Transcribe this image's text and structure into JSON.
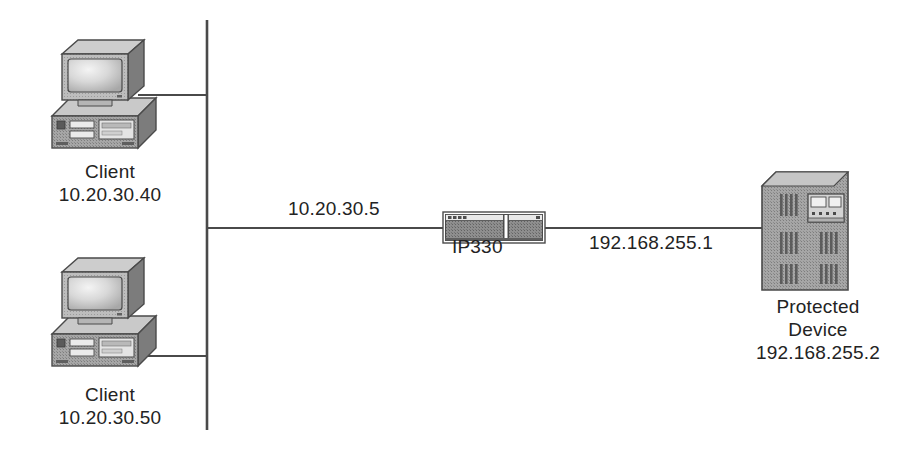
{
  "diagram": {
    "type": "network-topology",
    "title": "",
    "background_color": "#ffffff",
    "line_color": "#4a4a4a",
    "text_color": "#232323",
    "device_fill": "#9a9a9a",
    "device_shade_light": "#c4c4c4",
    "device_shade_dark": "#6e6e6e",
    "nodes": [
      {
        "id": "client-top",
        "icon": "desktop-computer-icon",
        "name": "Client",
        "ip": "10.20.30.40"
      },
      {
        "id": "client-bottom",
        "icon": "desktop-computer-icon",
        "name": "Client",
        "ip": "10.20.30.50"
      },
      {
        "id": "ip330",
        "icon": "firewall-appliance-icon",
        "name": "IP330",
        "ip": ""
      },
      {
        "id": "protected-device",
        "icon": "server-tower-icon",
        "name_line1": "Protected",
        "name_line2": "Device",
        "ip": "192.168.255.2"
      }
    ],
    "links": [
      {
        "id": "lan-trunk",
        "from": "lan-bus",
        "to": "ip330",
        "label": "10.20.30.5"
      },
      {
        "id": "wan-link",
        "from": "ip330",
        "to": "protected-device",
        "label": "192.168.255.1"
      }
    ]
  },
  "labels": {
    "client_top_name": "Client",
    "client_top_ip": "10.20.30.40",
    "client_bottom_name": "Client",
    "client_bottom_ip": "10.20.30.50",
    "ip330_name": "IP330",
    "protected_name_line1": "Protected",
    "protected_name_line2": "Device",
    "protected_ip": "192.168.255.2",
    "trunk_ip": "10.20.30.5",
    "wan_ip": "192.168.255.1"
  }
}
